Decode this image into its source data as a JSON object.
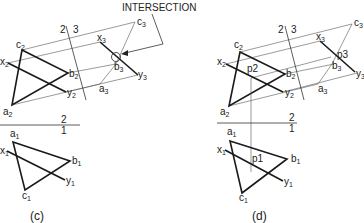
{
  "annotation": {
    "intersection_label": "INTERSECTION"
  },
  "panels": {
    "c": {
      "caption": "(c)",
      "fold_2_3": {
        "left": "2",
        "right": "3"
      },
      "fold_2_1": {
        "top": "2",
        "bottom": "1"
      },
      "view2": {
        "a": "a",
        "b": "b",
        "c": "c",
        "x": "x",
        "y": "y",
        "sub": "2"
      },
      "view3": {
        "a": "a",
        "b": "b",
        "c": "c",
        "x": "x",
        "y": "y",
        "sub": "3"
      },
      "view1": {
        "a": "a",
        "b": "b",
        "c": "c",
        "x": "x",
        "y": "y",
        "sub": "1"
      }
    },
    "d": {
      "caption": "(d)",
      "fold_2_3": {
        "left": "2",
        "right": "3"
      },
      "fold_2_1": {
        "top": "2",
        "bottom": "1"
      },
      "view2": {
        "a": "a",
        "b": "b",
        "c": "c",
        "x": "x",
        "y": "y",
        "sub": "2",
        "p": "p2"
      },
      "view3": {
        "a": "a",
        "b": "b",
        "c": "c",
        "x": "x",
        "y": "y",
        "sub": "3",
        "p": "p3"
      },
      "view1": {
        "a": "a",
        "b": "b",
        "c": "c",
        "x": "x",
        "y": "y",
        "sub": "1",
        "p": "p1"
      }
    }
  },
  "colors": {
    "line": "#1a1a1a",
    "projector": "#555555",
    "background": "#ffffff"
  }
}
